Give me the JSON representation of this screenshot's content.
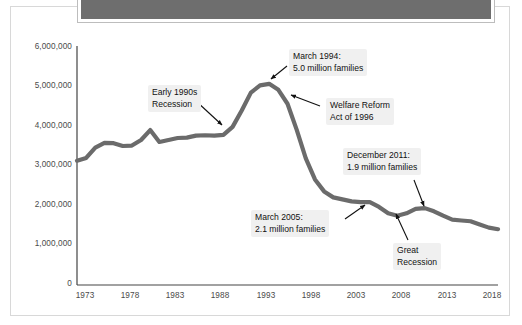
{
  "page": {
    "title_bar": {
      "name": "redacted-title-bar",
      "color": "#6e6e6e",
      "text": ""
    }
  },
  "chart_data": {
    "type": "line",
    "title": "",
    "subtitle": "",
    "xlabel": "",
    "ylabel": "",
    "grid": false,
    "legend": "none",
    "line_color": "#6b6b6b",
    "xlim": [
      1973,
      2019
    ],
    "ylim": [
      0,
      6000000
    ],
    "xticks": [
      "1973",
      "1978",
      "1983",
      "1988",
      "1993",
      "1998",
      "2003",
      "2008",
      "2013",
      "2018"
    ],
    "xtick_values": [
      1973,
      1978,
      1983,
      1988,
      1993,
      1998,
      2003,
      2008,
      2013,
      2018
    ],
    "yticks": [
      "0",
      "1,000,000",
      "2,000,000",
      "3,000,000",
      "4,000,000",
      "5,000,000",
      "6,000,000"
    ],
    "ytick_values": [
      0,
      1000000,
      2000000,
      3000000,
      4000000,
      5000000,
      6000000
    ],
    "series": [
      {
        "name": "Families receiving assistance",
        "x": [
          1973,
          1974,
          1975,
          1976,
          1977,
          1978,
          1979,
          1980,
          1981,
          1982,
          1983,
          1984,
          1985,
          1986,
          1987,
          1988,
          1989,
          1990,
          1991,
          1992,
          1993,
          1994,
          1995,
          1996,
          1997,
          1998,
          1999,
          2000,
          2001,
          2002,
          2003,
          2004,
          2005,
          2006,
          2007,
          2008,
          2009,
          2010,
          2011,
          2012,
          2013,
          2014,
          2015,
          2016,
          2017,
          2018,
          2019
        ],
        "values": [
          3120000,
          3190000,
          3450000,
          3570000,
          3560000,
          3490000,
          3500000,
          3640000,
          3890000,
          3590000,
          3640000,
          3690000,
          3700000,
          3750000,
          3760000,
          3750000,
          3770000,
          3970000,
          4380000,
          4830000,
          5010000,
          5050000,
          4900000,
          4550000,
          3900000,
          3180000,
          2650000,
          2350000,
          2200000,
          2150000,
          2100000,
          2080000,
          2080000,
          1960000,
          1800000,
          1740000,
          1800000,
          1910000,
          1930000,
          1850000,
          1740000,
          1640000,
          1620000,
          1600000,
          1520000,
          1440000,
          1400000
        ]
      }
    ],
    "annotations": [
      {
        "id": "early-1990s-recession",
        "lines": [
          "Early 1990s",
          "Recession"
        ],
        "point_x": 1990,
        "point_y": 3970000
      },
      {
        "id": "march-1994",
        "lines": [
          "March 1994:",
          "5.0 million families"
        ],
        "point_x": 1994,
        "point_y": 5050000
      },
      {
        "id": "welfare-reform-1996",
        "lines": [
          "Welfare Reform",
          "Act of 1996"
        ],
        "point_x": 1996,
        "point_y": 4550000
      },
      {
        "id": "march-2005",
        "lines": [
          "March 2005:",
          "2.1 million families"
        ],
        "point_x": 2005,
        "point_y": 2080000
      },
      {
        "id": "december-2011",
        "lines": [
          "December 2011:",
          "1.9 million families"
        ],
        "point_x": 2011,
        "point_y": 1930000
      },
      {
        "id": "great-recession",
        "lines": [
          "Great",
          "Recession"
        ],
        "point_x": 2008,
        "point_y": 1740000
      }
    ]
  }
}
